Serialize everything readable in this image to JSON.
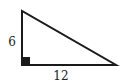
{
  "diagram": {
    "type": "right-triangle",
    "vertices": {
      "top": [
        22,
        11
      ],
      "right_angle": [
        22,
        65
      ],
      "bottom_right": [
        116,
        65
      ]
    },
    "right_angle_marker": "filled-square",
    "labels": {
      "vertical_leg": "6",
      "horizontal_leg": "12"
    },
    "colors": {
      "stroke": "#1a1a1a",
      "text": "#222222",
      "background": "#ffffff"
    }
  }
}
